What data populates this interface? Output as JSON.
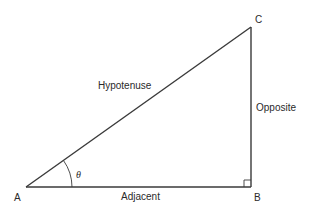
{
  "diagram": {
    "vertices": {
      "A": {
        "label": "A",
        "x": 26,
        "y": 187
      },
      "B": {
        "label": "B",
        "x": 251,
        "y": 187
      },
      "C": {
        "label": "C",
        "x": 251,
        "y": 27
      }
    },
    "sides": {
      "hypotenuse": "Hypotenuse",
      "opposite": "Opposite",
      "adjacent": "Adjacent"
    },
    "angle": {
      "symbol": "θ",
      "vertex": "A"
    },
    "right_angle_vertex": "B",
    "colors": {
      "line": "#3a3a3a",
      "text": "#2a2a2a",
      "background": "#ffffff"
    }
  }
}
